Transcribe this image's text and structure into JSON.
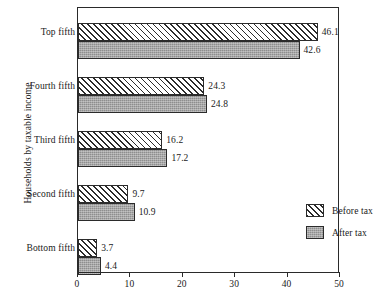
{
  "chart_data": {
    "type": "bar",
    "orientation": "horizontal",
    "title": "",
    "xlabel": "",
    "ylabel": "Households by taxable income",
    "categories": [
      "Top fifth",
      "Fourth fifth",
      "Third fifth",
      "Second fifth",
      "Bottom fifth"
    ],
    "series": [
      {
        "name": "Before tax",
        "values": [
          46.1,
          24.3,
          16.2,
          9.7,
          3.7
        ],
        "pattern": "diagonal-hatch"
      },
      {
        "name": "After tax",
        "values": [
          42.6,
          24.8,
          17.2,
          10.9,
          4.4
        ],
        "pattern": "solid-gray"
      }
    ],
    "value_labels": {
      "before": [
        "46.1",
        "24.3",
        "16.2",
        "9.7",
        "3.7"
      ],
      "after": [
        "42.6",
        "24.8",
        "17.2",
        "10.9",
        "4.4"
      ]
    },
    "xlim": [
      0,
      50
    ],
    "xticks": [
      0,
      10,
      20,
      30,
      40,
      50
    ],
    "xtick_labels": [
      "0",
      "10",
      "20",
      "30",
      "40",
      "50"
    ],
    "grid": false,
    "legend": {
      "position": "inside-lower-right",
      "entries": [
        "Before tax",
        "After tax"
      ]
    },
    "colors": {
      "axis": "#2a2a2a",
      "hatch_line": "#2b2b2b",
      "after_fill": "#8e8e8e",
      "background": "#ffffff",
      "text": "#1a1a1a"
    }
  }
}
